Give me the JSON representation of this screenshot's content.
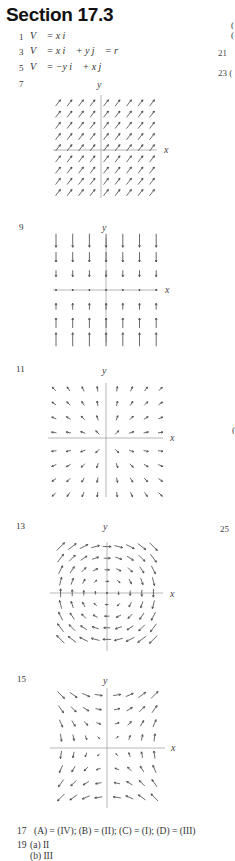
{
  "section": {
    "title": "Section 17.3"
  },
  "problems": [
    {
      "number": "1",
      "text": "V⃗  = x i⃗"
    },
    {
      "number": "3",
      "text": "V⃗  = x i⃗  + y j⃗  = r⃗"
    },
    {
      "number": "5",
      "text": "V⃗  = −y i⃗  + x j⃗"
    },
    {
      "number": "7",
      "text": ""
    },
    {
      "number": "9",
      "text": ""
    },
    {
      "number": "11",
      "text": ""
    },
    {
      "number": "13",
      "text": ""
    },
    {
      "number": "15",
      "text": ""
    },
    {
      "number": "17",
      "text": "(A) = (IV); (B) = (II); (C) = (I); (D) = (III)"
    },
    {
      "number": "19",
      "text": "(a)  II"
    }
  ],
  "answer_19b": "(b)  III",
  "right_column_fragments": [
    {
      "text": "(",
      "top": 20
    },
    {
      "text": "(",
      "top": 30
    },
    {
      "text": "21",
      "top": 48
    },
    {
      "text": "23 (",
      "top": 68
    },
    {
      "text": "(",
      "top": 425
    },
    {
      "text": "25",
      "top": 524
    }
  ],
  "plots": [
    {
      "id": "7",
      "x_label": "x",
      "y_label": "y",
      "field": "constant (1,1)"
    },
    {
      "id": "9",
      "x_label": "x",
      "y_label": "y",
      "field": "(0, -y)"
    },
    {
      "id": "11",
      "x_label": "x",
      "y_label": "y",
      "field": "radial outward r"
    },
    {
      "id": "13",
      "x_label": "x",
      "y_label": "y",
      "field": "rotational (y, -x)·r"
    },
    {
      "id": "15",
      "x_label": "x",
      "y_label": "y",
      "field": "(x+y, x-y)"
    }
  ],
  "chart_data": [
    {
      "type": "vector_field",
      "title": "7",
      "xlabel": "x",
      "ylabel": "y",
      "grid": "9x9",
      "vector": "constant, pointing up-right (45°)"
    },
    {
      "type": "vector_field",
      "title": "9",
      "xlabel": "x",
      "ylabel": "y",
      "grid": "7x7",
      "vector": "vertical, pointing toward x-axis, magnitude proportional to |y|, zero on x-axis"
    },
    {
      "type": "vector_field",
      "title": "11",
      "xlabel": "x",
      "ylabel": "y",
      "grid": "8x8",
      "vector": "radial outward from origin"
    },
    {
      "type": "vector_field",
      "title": "13",
      "xlabel": "x",
      "ylabel": "y",
      "grid": "9x9",
      "vector": "clockwise rotation, magnitude growing with distance"
    },
    {
      "type": "vector_field",
      "title": "15",
      "xlabel": "x",
      "ylabel": "y",
      "grid": "8x8",
      "vector": "saddle-like field (x+y direction mixes)"
    }
  ]
}
